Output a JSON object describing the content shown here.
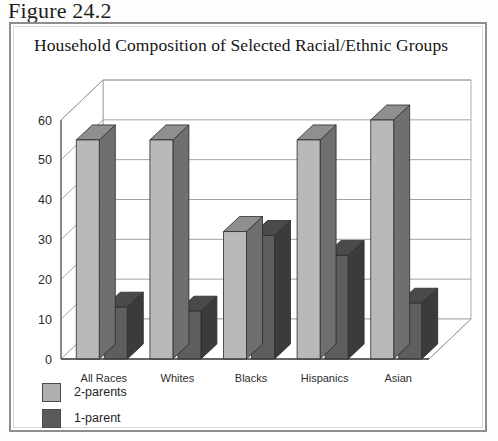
{
  "figure": {
    "label": "Figure 24.2"
  },
  "legend": {
    "items": [
      {
        "label": "2-parents",
        "color": "#b0b0b0"
      },
      {
        "label": "1-parent",
        "color": "#5a5a5a"
      }
    ]
  },
  "colors": {
    "series_2parents_front": "#b9b9b9",
    "series_2parents_top": "#8f8f8f",
    "series_2parents_side": "#6f6f6f",
    "series_1parent_front": "#5e5e5e",
    "series_1parent_top": "#4a4a4a",
    "series_1parent_side": "#3b3b3b",
    "frame": "#8d8d8d",
    "gridline": "#9a9a9a",
    "background": "#ffffff",
    "text": "#1c1c1c"
  },
  "chart_data": {
    "type": "bar",
    "title": "Household Composition of Selected Racial/Ethnic Groups",
    "xlabel": "",
    "ylabel": "",
    "ylim": [
      0,
      60
    ],
    "yticks": [
      0,
      10,
      20,
      30,
      40,
      50,
      60
    ],
    "ytick_labels": [
      "0",
      "10",
      "20",
      "30",
      "40",
      "50",
      "60"
    ],
    "grid": true,
    "legend_position": "below-left",
    "three_d": true,
    "categories": [
      "All Races",
      "Whites",
      "Blacks",
      "Hispanics",
      "Asian"
    ],
    "series": [
      {
        "name": "2-parents",
        "values": [
          55,
          55,
          32,
          55,
          60
        ]
      },
      {
        "name": "1-parent",
        "values": [
          13,
          12,
          31,
          26,
          14
        ]
      }
    ]
  }
}
